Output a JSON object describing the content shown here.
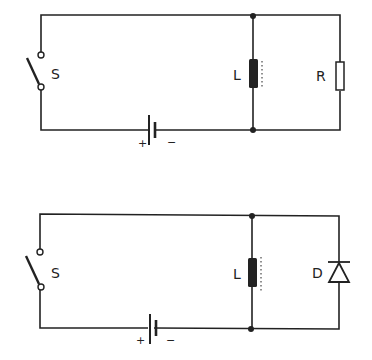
{
  "diagram": {
    "type": "circuit-schematic",
    "circuits": [
      {
        "id": "top",
        "description": "Switch S and battery in series, inductor L in parallel with resistor R",
        "components": {
          "switch": {
            "label": "S"
          },
          "battery": {
            "plus": "+",
            "minus": "−"
          },
          "inductor": {
            "label": "L"
          },
          "load": {
            "type": "resistor",
            "label": "R"
          }
        }
      },
      {
        "id": "bottom",
        "description": "Switch S and battery in series, inductor L in parallel with diode D",
        "components": {
          "switch": {
            "label": "S"
          },
          "battery": {
            "plus": "+",
            "minus": "−"
          },
          "inductor": {
            "label": "L"
          },
          "load": {
            "type": "diode",
            "label": "D"
          }
        }
      }
    ],
    "colors": {
      "ink": "#222222",
      "background": "#ffffff"
    }
  }
}
